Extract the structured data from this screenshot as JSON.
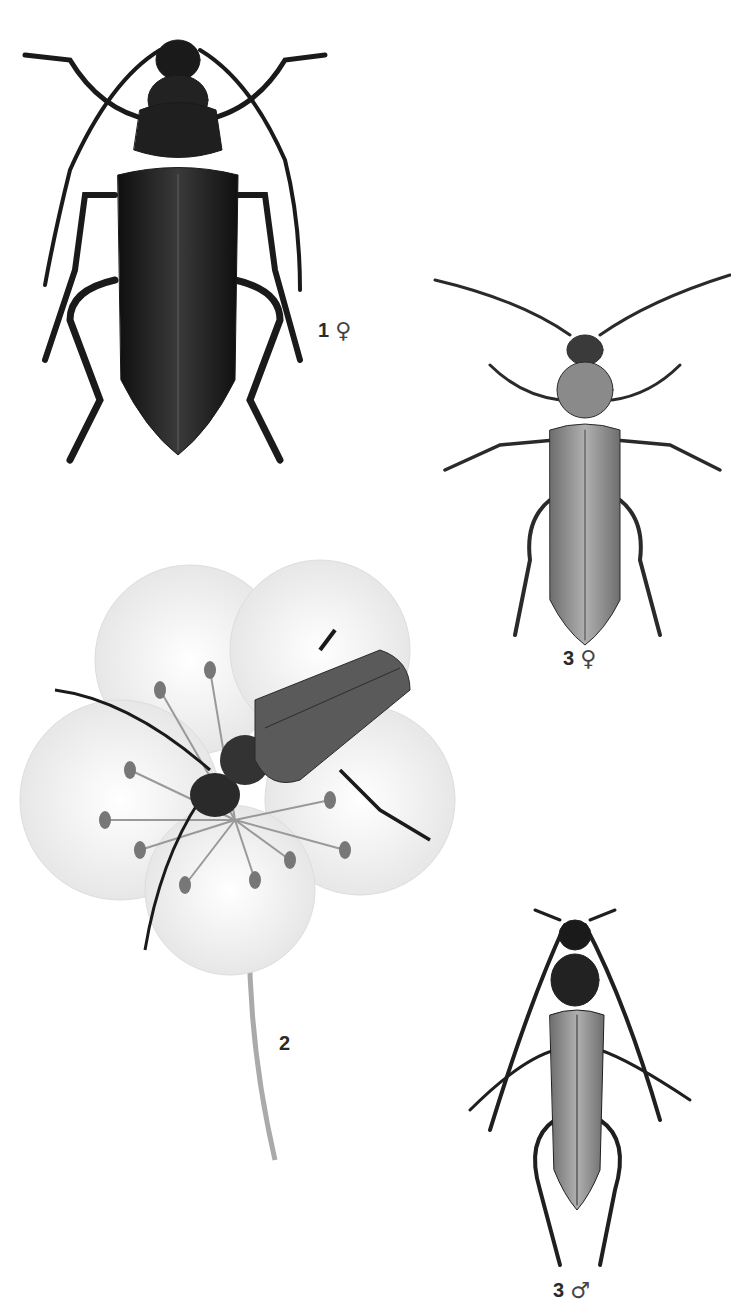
{
  "plate": {
    "description": "Scientific illustration plate of longhorn-type beetles",
    "figures": [
      {
        "id": "fig1",
        "number": "1",
        "sex_symbol": "♀",
        "sex": "female",
        "subject": "large dark beetle, dorsal view"
      },
      {
        "id": "fig2",
        "number": "2",
        "sex_symbol": "",
        "sex": "",
        "subject": "beetle on white flower with stamens"
      },
      {
        "id": "fig3f",
        "number": "3",
        "sex_symbol": "♀",
        "sex": "female",
        "subject": "slender beetle, dorsal view"
      },
      {
        "id": "fig3m",
        "number": "3",
        "sex_symbol": "♂",
        "sex": "male",
        "subject": "slender beetle with dark thorax, dorsal view"
      }
    ]
  },
  "colors": {
    "background": "#ffffff",
    "dark_beetle": "#1c1c1c",
    "mid_beetle": "#8a8a8a",
    "flower_shade": "#e8e8e8",
    "label_text": "#2a2a2a"
  }
}
